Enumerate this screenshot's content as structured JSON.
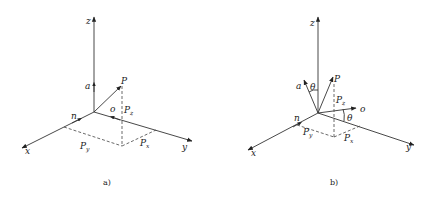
{
  "figure": {
    "panels": [
      {
        "id": "a",
        "caption": "a)",
        "axes": {
          "x": "x",
          "y": "y",
          "z": "z"
        },
        "vectors": {
          "a": "a",
          "n": "n",
          "o": "o",
          "P": "P"
        },
        "components": {
          "Px": {
            "base": "P",
            "sub": "x"
          },
          "Py": {
            "base": "P",
            "sub": "y"
          },
          "Pz": {
            "base": "P",
            "sub": "z"
          }
        }
      },
      {
        "id": "b",
        "caption": "b)",
        "axes": {
          "x": "x",
          "y": "y",
          "z": "z"
        },
        "vectors": {
          "a": "a",
          "n": "n",
          "o": "o",
          "P": "P"
        },
        "angles": {
          "theta_a": "θ",
          "theta_o": "θ"
        },
        "components": {
          "Px": {
            "base": "P",
            "sub": "x"
          },
          "Py": {
            "base": "P",
            "sub": "y"
          },
          "Pz": {
            "base": "P",
            "sub": "z"
          }
        }
      }
    ]
  }
}
